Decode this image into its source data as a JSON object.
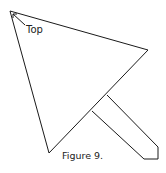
{
  "diagram": {
    "annotation": "Top",
    "caption": "Figure 9.",
    "stroke_color": "#1a1a1a",
    "shapes": {
      "triangle": [
        [
          10,
          11
        ],
        [
          148,
          50
        ],
        [
          49,
          153
        ]
      ],
      "handle": [
        [
          107,
          95
        ],
        [
          158,
          147
        ],
        [
          158,
          159
        ],
        [
          144,
          159
        ],
        [
          92,
          111
        ]
      ],
      "arrow": {
        "from": [
          26,
          26
        ],
        "to": [
          13,
          14
        ]
      }
    }
  }
}
